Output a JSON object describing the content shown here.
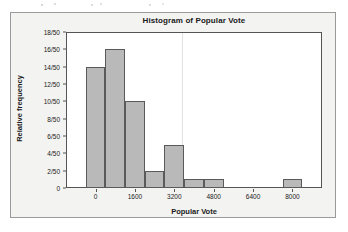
{
  "chart_data": {
    "type": "bar",
    "title": "Histogram of Popular Vote",
    "xlabel": "Popular Vote",
    "ylabel": "Relative frequency",
    "grid": false,
    "legend": null,
    "xlim": [
      -1200,
      9200
    ],
    "ylim": [
      0,
      18
    ],
    "y_unit": "counts out of 50",
    "bin_width": 800,
    "x_tick_labels": [
      "0",
      "1600",
      "3200",
      "4800",
      "6400",
      "8000"
    ],
    "x_tick_values": [
      0,
      1600,
      3200,
      4800,
      6400,
      8000
    ],
    "y_tick_labels": [
      "0",
      "2/50",
      "4/50",
      "6/50",
      "8/50",
      "10/50",
      "12/50",
      "14/50",
      "16/50",
      "18/50"
    ],
    "y_tick_values": [
      0,
      2,
      4,
      6,
      8,
      10,
      12,
      14,
      16,
      18
    ],
    "bins": [
      {
        "left": -400,
        "right": 400,
        "value": 14,
        "label": "14/50"
      },
      {
        "left": 400,
        "right": 1200,
        "value": 16,
        "label": "16/50"
      },
      {
        "left": 1200,
        "right": 2000,
        "value": 10,
        "label": "10/50"
      },
      {
        "left": 2000,
        "right": 2800,
        "value": 2,
        "label": "2/50"
      },
      {
        "left": 2800,
        "right": 3600,
        "value": 5,
        "label": "5/50"
      },
      {
        "left": 3600,
        "right": 4400,
        "value": 1,
        "label": "1/50"
      },
      {
        "left": 4400,
        "right": 5200,
        "value": 1,
        "label": "1/50"
      },
      {
        "left": 7600,
        "right": 8400,
        "value": 1,
        "label": "1/50"
      }
    ],
    "categories": [
      "-400 to 400",
      "400 to 1200",
      "1200 to 2000",
      "2000 to 2800",
      "2800 to 3600",
      "3600 to 4400",
      "4400 to 5200",
      "7600 to 8400"
    ],
    "values": [
      14,
      16,
      10,
      2,
      5,
      1,
      1,
      1
    ],
    "colors": {
      "bar_fill": "#b9b9b9",
      "bar_edge": "#5a5a5a",
      "axis": "#555555",
      "text": "#1a1a1a",
      "panel_background": "#ffffff",
      "page_background": "#f3f3f1"
    }
  }
}
